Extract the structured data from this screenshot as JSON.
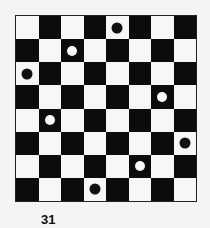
{
  "figure": {
    "caption": "31",
    "board": {
      "rows": 8,
      "cols": 8,
      "top_left_color": "light",
      "colors": {
        "dark": "#0c0c0c",
        "light": "#f7f7f5"
      },
      "pieces": [
        {
          "row": 0,
          "col": 4,
          "color": "black"
        },
        {
          "row": 1,
          "col": 2,
          "color": "white"
        },
        {
          "row": 2,
          "col": 0,
          "color": "black"
        },
        {
          "row": 3,
          "col": 6,
          "color": "white"
        },
        {
          "row": 4,
          "col": 1,
          "color": "white"
        },
        {
          "row": 5,
          "col": 7,
          "color": "black"
        },
        {
          "row": 6,
          "col": 5,
          "color": "white"
        },
        {
          "row": 7,
          "col": 3,
          "color": "black"
        }
      ]
    }
  }
}
